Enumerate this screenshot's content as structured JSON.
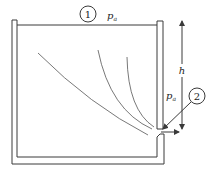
{
  "figure": {
    "point_1": {
      "label": "1",
      "pressure_label": "p",
      "pressure_subscript": "a"
    },
    "point_2": {
      "label": "2",
      "pressure_label": "p",
      "pressure_subscript": "a"
    },
    "height": {
      "label": "h"
    },
    "colors": {
      "line": "#3a3a3a",
      "background": "#ffffff"
    },
    "streamline_count": 3
  }
}
